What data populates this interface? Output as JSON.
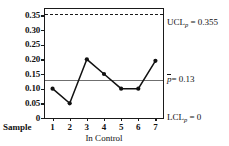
{
  "chart_data": {
    "type": "line",
    "title": "",
    "subtitle": "",
    "xlabel": "In Control",
    "ylabel": "",
    "x_axis_name": "Sample",
    "categories": [
      "1",
      "2",
      "3",
      "4",
      "5",
      "6",
      "7"
    ],
    "values": [
      0.1,
      0.05,
      0.2,
      0.15,
      0.1,
      0.1,
      0.195
    ],
    "series": [
      {
        "name": "Proportion nonconforming",
        "values": [
          0.1,
          0.05,
          0.2,
          0.15,
          0.1,
          0.1,
          0.195
        ]
      }
    ],
    "ylim": [
      0,
      0.375
    ],
    "xlim": [
      0.5,
      7.5
    ],
    "y_ticks": [
      "0",
      "0.05",
      "0.10",
      "0.15",
      "0.20",
      "0.25",
      "0.30",
      "0.35"
    ],
    "y_tick_values": [
      0,
      0.05,
      0.1,
      0.15,
      0.2,
      0.25,
      0.3,
      0.35
    ],
    "grid": false,
    "legend": "none",
    "marker": "filled-circle",
    "control_limits": {
      "ucl": {
        "value": 0.355,
        "label_prefix": "UCL",
        "label_subscript": "p",
        "label_value": "= 0.355",
        "line_style": "dashed",
        "color": "#1a1a1a"
      },
      "center": {
        "value": 0.13,
        "label_symbol": "p",
        "label_value": "= 0.13",
        "line_style": "solid",
        "color": "#6f6f6f"
      },
      "lcl": {
        "value": 0,
        "label_prefix": "LCL",
        "label_subscript": "p",
        "label_value": "= 0",
        "line_style": "none",
        "color": "#1a1a1a"
      }
    },
    "colors": {
      "series_line": "#111111",
      "marker": "#111111",
      "axis": "#1a1a1a",
      "center_line": "#6f6f6f",
      "background": "#ffffff"
    }
  }
}
